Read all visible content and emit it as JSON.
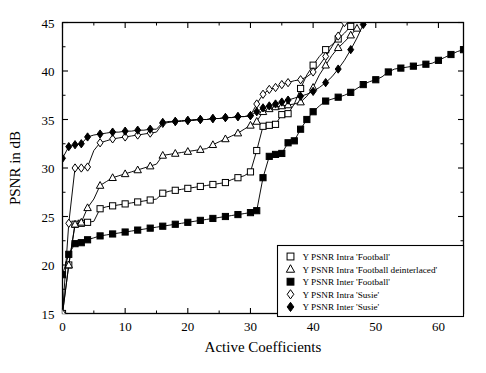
{
  "chart_data": {
    "type": "line",
    "title": "",
    "xlabel": "Active Coefficients",
    "ylabel": "PSNR in dB",
    "xlim": [
      0,
      64
    ],
    "ylim": [
      15,
      45
    ],
    "xticks": [
      0,
      10,
      20,
      30,
      40,
      50,
      60
    ],
    "yticks": [
      15,
      20,
      25,
      30,
      35,
      40,
      45
    ],
    "xtick_labels": [
      "0",
      "10",
      "20",
      "30",
      "40",
      "50",
      "60"
    ],
    "ytick_labels": [
      "15",
      "20",
      "25",
      "30",
      "35",
      "40",
      "45"
    ],
    "minor_ticks": true,
    "grid": false,
    "legend_position": "lower-right",
    "series": [
      {
        "name": "Y PSNR Intra 'Football'",
        "marker": "open-square",
        "x": [
          0,
          1,
          2,
          3,
          4,
          5,
          6,
          7,
          8,
          9,
          10,
          11,
          12,
          13,
          14,
          15,
          16,
          17,
          18,
          19,
          20,
          21,
          22,
          23,
          24,
          25,
          26,
          27,
          28,
          29,
          30,
          31,
          32,
          33,
          34,
          35,
          36,
          37,
          38,
          39,
          40,
          41,
          42,
          43,
          44,
          45,
          46
        ],
        "y": [
          15.0,
          20.0,
          24.2,
          24.3,
          24.4,
          24.5,
          25.8,
          26.0,
          26.1,
          26.2,
          26.3,
          26.4,
          26.5,
          26.6,
          26.7,
          26.8,
          27.4,
          27.6,
          27.7,
          27.8,
          27.9,
          28.0,
          28.1,
          28.2,
          28.3,
          28.4,
          28.5,
          28.8,
          29.0,
          29.2,
          29.6,
          31.8,
          34.3,
          34.4,
          34.5,
          35.5,
          35.6,
          36.6,
          38.2,
          39.6,
          40.6,
          41.5,
          42.2,
          42.7,
          43.3,
          43.9,
          44.6
        ]
      },
      {
        "name": "Y PSNR Intra 'Football deinterlaced'",
        "marker": "open-triangle",
        "x": [
          0,
          1,
          2,
          3,
          4,
          5,
          6,
          7,
          8,
          9,
          10,
          11,
          12,
          13,
          14,
          15,
          16,
          17,
          18,
          19,
          20,
          21,
          22,
          23,
          24,
          25,
          26,
          27,
          28,
          29,
          30,
          31,
          32,
          33,
          34,
          35,
          36,
          37,
          38,
          39,
          40,
          41,
          42,
          43,
          44,
          45,
          46,
          47
        ],
        "y": [
          15.0,
          20.0,
          24.2,
          24.4,
          25.9,
          26.8,
          28.2,
          28.6,
          29.0,
          29.2,
          29.4,
          29.6,
          29.8,
          30.0,
          30.2,
          30.4,
          31.3,
          31.4,
          31.5,
          31.6,
          31.7,
          31.8,
          31.9,
          32.0,
          32.4,
          32.7,
          33.0,
          33.3,
          33.6,
          34.0,
          34.4,
          34.8,
          35.8,
          36.1,
          36.3,
          36.4,
          36.5,
          36.6,
          36.8,
          37.4,
          38.3,
          39.6,
          40.6,
          41.6,
          42.4,
          43.0,
          43.7,
          44.4
        ]
      },
      {
        "name": "Y PSNR Inter 'Football'",
        "marker": "filled-square",
        "x": [
          0,
          1,
          2,
          3,
          4,
          5,
          6,
          7,
          8,
          9,
          10,
          11,
          12,
          13,
          14,
          15,
          16,
          17,
          18,
          19,
          20,
          21,
          22,
          23,
          24,
          25,
          26,
          27,
          28,
          29,
          30,
          31,
          32,
          33,
          34,
          35,
          36,
          37,
          38,
          39,
          40,
          41,
          42,
          43,
          44,
          45,
          46,
          47,
          48,
          49,
          50,
          51,
          52,
          53,
          54,
          55,
          56,
          57,
          58,
          59,
          60,
          61,
          62,
          63,
          64
        ],
        "y": [
          19.0,
          21.1,
          22.2,
          22.3,
          22.6,
          22.8,
          23.0,
          23.1,
          23.2,
          23.3,
          23.4,
          23.5,
          23.6,
          23.7,
          23.8,
          23.9,
          24.0,
          24.1,
          24.2,
          24.3,
          24.4,
          24.5,
          24.6,
          24.7,
          24.8,
          24.9,
          25.0,
          25.1,
          25.2,
          25.3,
          25.4,
          25.6,
          29.0,
          31.2,
          31.4,
          31.5,
          32.6,
          32.8,
          34.0,
          35.0,
          35.8,
          36.4,
          36.9,
          37.1,
          37.3,
          37.5,
          37.8,
          38.2,
          38.6,
          38.9,
          39.1,
          39.4,
          39.9,
          40.2,
          40.3,
          40.4,
          40.5,
          40.6,
          40.7,
          40.8,
          41.1,
          41.4,
          41.7,
          42.0,
          42.2
        ]
      },
      {
        "name": "Y PSNR Intra 'Susie'",
        "marker": "open-diamond",
        "x": [
          0,
          1,
          2,
          3,
          4,
          5,
          6,
          7,
          8,
          9,
          10,
          11,
          12,
          13,
          14,
          15,
          16,
          17,
          18,
          19,
          20,
          21,
          22,
          23,
          24,
          25,
          26,
          27,
          28,
          29,
          30,
          31,
          32,
          33,
          34,
          35,
          36,
          37,
          38,
          39,
          40,
          41,
          42,
          43,
          44,
          45
        ],
        "y": [
          15.0,
          24.3,
          30.0,
          30.0,
          30.1,
          31.8,
          32.6,
          32.8,
          33.0,
          33.1,
          33.2,
          33.3,
          33.4,
          33.5,
          33.6,
          33.7,
          34.6,
          34.7,
          34.8,
          34.8,
          34.9,
          34.9,
          35.0,
          35.0,
          35.1,
          35.1,
          35.2,
          35.2,
          35.3,
          35.3,
          35.4,
          36.6,
          37.6,
          38.1,
          38.3,
          38.6,
          38.8,
          39.0,
          39.1,
          39.4,
          39.9,
          40.6,
          41.5,
          42.5,
          43.6,
          45.0
        ]
      },
      {
        "name": "Y PSNR Inter 'Susie'",
        "marker": "filled-diamond",
        "x": [
          0,
          1,
          2,
          3,
          4,
          5,
          6,
          7,
          8,
          9,
          10,
          11,
          12,
          13,
          14,
          15,
          16,
          17,
          18,
          19,
          20,
          21,
          22,
          23,
          24,
          25,
          26,
          27,
          28,
          29,
          30,
          31,
          32,
          33,
          34,
          35,
          36,
          37,
          38,
          39,
          40,
          41,
          42,
          43,
          44,
          45,
          46,
          47,
          48
        ],
        "y": [
          31.0,
          32.2,
          32.4,
          32.5,
          33.2,
          33.4,
          33.5,
          33.6,
          33.7,
          33.7,
          33.8,
          33.8,
          33.9,
          33.9,
          34.0,
          34.0,
          34.7,
          34.8,
          34.8,
          34.9,
          34.9,
          35.0,
          35.0,
          35.0,
          35.1,
          35.1,
          35.2,
          35.2,
          35.3,
          35.3,
          35.4,
          35.8,
          36.2,
          36.4,
          36.6,
          36.8,
          37.0,
          37.2,
          37.4,
          37.6,
          37.9,
          38.3,
          38.8,
          39.4,
          40.2,
          41.1,
          42.2,
          43.4,
          44.8
        ]
      }
    ],
    "legend": [
      {
        "label": "Y PSNR Intra 'Football'",
        "marker": "open-square"
      },
      {
        "label": "Y PSNR Intra 'Football deinterlaced'",
        "marker": "open-triangle"
      },
      {
        "label": "Y PSNR Inter 'Football'",
        "marker": "filled-square"
      },
      {
        "label": "Y PSNR Intra 'Susie'",
        "marker": "open-diamond"
      },
      {
        "label": "Y PSNR Inter 'Susie'",
        "marker": "filled-diamond"
      }
    ],
    "colors": {
      "line": "#000000",
      "axis": "#000000",
      "background": "#ffffff"
    }
  }
}
